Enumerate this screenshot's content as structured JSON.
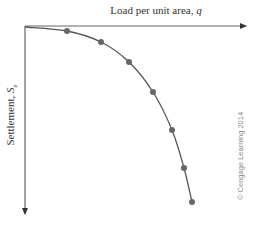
{
  "chart_data": {
    "type": "line",
    "title": "",
    "xlabel": "Load per unit area, q",
    "ylabel": "Settlement, Se",
    "x_axis_position": "top",
    "y_axis_direction": "downward",
    "grid": false,
    "legend": null,
    "ticks": "none",
    "series": [
      {
        "name": "Load-settlement curve",
        "color": "#666666",
        "marker": "circle",
        "points_px": [
          [
            67,
            31
          ],
          [
            101,
            42
          ],
          [
            129,
            62
          ],
          [
            153,
            92
          ],
          [
            172,
            130
          ],
          [
            184,
            168
          ],
          [
            192,
            202
          ]
        ],
        "x_relative": [
          0.19,
          0.34,
          0.47,
          0.58,
          0.66,
          0.72,
          0.75
        ],
        "y_relative": [
          0.03,
          0.09,
          0.19,
          0.35,
          0.55,
          0.75,
          0.94
        ]
      }
    ],
    "annotations": [
      "© Cengage Learning 2014"
    ]
  },
  "labels": {
    "x_axis_text": "Load per unit area, ",
    "x_axis_var": "q",
    "y_axis_text": "Settlement, ",
    "y_axis_var": "S",
    "y_axis_sub": "e",
    "copyright": "© Cengage Learning 2014"
  },
  "colors": {
    "axis": "#555555",
    "curve": "#555555",
    "marker": "#666666"
  }
}
